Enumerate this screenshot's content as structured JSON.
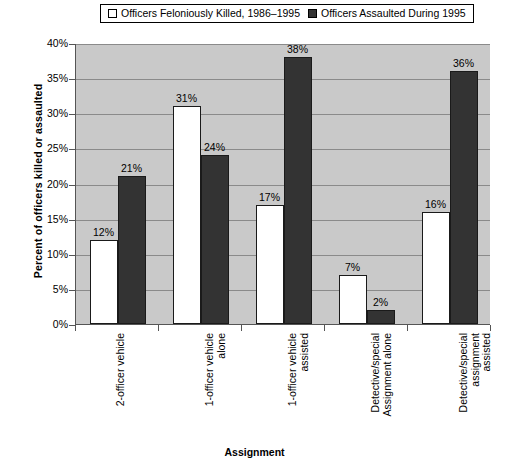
{
  "legend": {
    "entries": [
      {
        "label": "Officers Feloniously Killed, 1986–1995",
        "swatch": "white",
        "color": "#ffffff"
      },
      {
        "label": "Officers Assaulted During 1995",
        "swatch": "dark",
        "color": "#333333"
      }
    ]
  },
  "axes": {
    "ylabel": "Percent of officers killed or assaulted",
    "xlabel": "Assignment",
    "yticks": [
      "0%",
      "5%",
      "10%",
      "15%",
      "20%",
      "25%",
      "30%",
      "35%",
      "40%"
    ]
  },
  "colors": {
    "plot_background": "#c9c9c9",
    "gridline": "#8a8a8a",
    "series_killed": "#ffffff",
    "series_assaulted": "#333333",
    "page_background": "#ffffff"
  },
  "chart_data": {
    "type": "bar",
    "title": "",
    "xlabel": "Assignment",
    "ylabel": "Percent of officers killed or assaulted",
    "ylim": [
      0,
      40
    ],
    "ytick_values": [
      0,
      5,
      10,
      15,
      20,
      25,
      30,
      35,
      40
    ],
    "ytick_labels": [
      "0%",
      "5%",
      "10%",
      "15%",
      "20%",
      "25%",
      "30%",
      "35%",
      "40%"
    ],
    "grid": true,
    "legend_position": "top",
    "categories": [
      "2-officer vehicle",
      "1-officer vehicle alone",
      "1-officer vehicle assisted",
      "Detective/special Assignment alone",
      "Detective/special assignment assisted"
    ],
    "category_lines": [
      [
        "2-officer vehicle"
      ],
      [
        "1-officer vehicle",
        "alone"
      ],
      [
        "1-officer vehicle",
        "assisted"
      ],
      [
        "Detective/special",
        "Assignment alone"
      ],
      [
        "Detective/special",
        "assignment",
        "assisted"
      ]
    ],
    "series": [
      {
        "name": "Officers Feloniously Killed, 1986–1995",
        "color": "#ffffff",
        "values": [
          12,
          31,
          17,
          7,
          16
        ],
        "labels": [
          "12%",
          "31%",
          "17%",
          "7%",
          "16%"
        ]
      },
      {
        "name": "Officers Assaulted During 1995",
        "color": "#333333",
        "values": [
          21,
          24,
          38,
          2,
          36
        ],
        "labels": [
          "21%",
          "24%",
          "38%",
          "2%",
          "36%"
        ]
      }
    ]
  }
}
